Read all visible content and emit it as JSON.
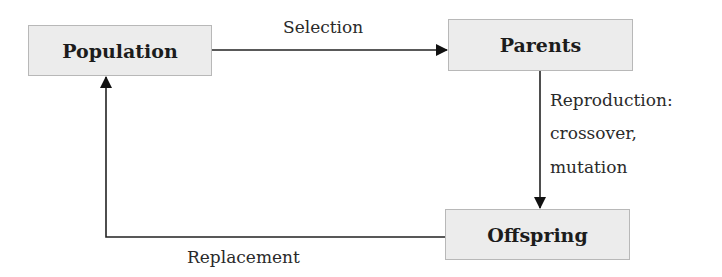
{
  "diagram": {
    "nodes": {
      "population": "Population",
      "parents": "Parents",
      "offspring": "Offspring"
    },
    "edges": {
      "selection": "Selection",
      "reproduction_line1": "Reproduction:",
      "reproduction_line2": "crossover,",
      "reproduction_line3": "mutation",
      "replacement": "Replacement"
    }
  }
}
